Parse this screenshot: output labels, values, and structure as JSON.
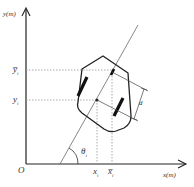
{
  "diagram": {
    "type": "robot-pose-coordinate-diagram",
    "axes": {
      "y_label": "y(m)",
      "x_label": "x(m)",
      "origin_label": "O"
    },
    "labels": {
      "y_bar": "y̅",
      "y_bar_sub": "i",
      "y": "y",
      "y_sub": "i",
      "x": "x",
      "x_sub": "i",
      "x_bar": "x̅",
      "x_bar_sub": "i",
      "theta": "θ",
      "theta_sub": "i",
      "d": "d"
    },
    "colors": {
      "stroke": "#222222",
      "dashed": "#888888",
      "background": "#ffffff"
    }
  }
}
